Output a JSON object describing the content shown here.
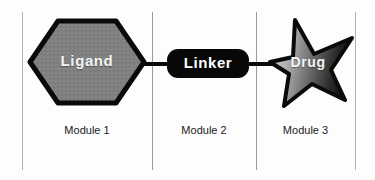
{
  "figure": {
    "type": "diagram",
    "background_color": "#fdfdfd"
  },
  "modules": [
    {
      "id": "module-1",
      "caption": "Module 1",
      "component_label": "Ligand",
      "shape": "hexagon",
      "fill_color": "#808080",
      "stroke_color": "#0a0a0a",
      "text_color": "#f4f4f4"
    },
    {
      "id": "module-2",
      "caption": "Module 2",
      "component_label": "Linker",
      "shape": "rounded-rectangle",
      "fill_color": "#080808",
      "stroke_color": "#080808",
      "text_color": "#ffffff"
    },
    {
      "id": "module-3",
      "caption": "Module 3",
      "component_label": "Drug",
      "shape": "five-point-star",
      "fill_gradient_from": "#c8c8c8",
      "fill_gradient_to": "#0a0a0a",
      "stroke_color": "#0a0a0a",
      "text_color": "#f4f4f4"
    }
  ],
  "connectors": [
    {
      "id": "bond-left",
      "from": "Ligand",
      "to": "Linker",
      "color": "#0a0a0a"
    },
    {
      "id": "bond-right",
      "from": "Linker",
      "to": "Drug",
      "color": "#0a0a0a"
    }
  ],
  "dividers": {
    "color": "#9a9a9a",
    "edge_color": "#b4b4b4",
    "count": 4
  }
}
